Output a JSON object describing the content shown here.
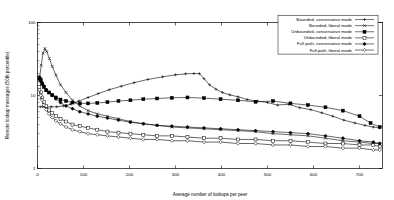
{
  "chart_data": {
    "type": "line",
    "title": "",
    "xlabel": "Average number of lookups per peer",
    "ylabel": "Remote lookup messages (50th percentile)",
    "xlim": [
      0,
      750
    ],
    "ylim": [
      1,
      100
    ],
    "yscale": "log",
    "grid": false,
    "legend_position": "top-right",
    "xticks": [
      0,
      100,
      200,
      300,
      400,
      500,
      600,
      700
    ],
    "xtick_labels": [
      "0",
      "100",
      "200",
      "300",
      "400",
      "500",
      "600",
      "700"
    ],
    "yticks": [
      1,
      10,
      100
    ],
    "ytick_labels": [
      "1",
      "10",
      "100"
    ],
    "series": [
      {
        "name": "Bounded, conservative mode",
        "marker": "plus",
        "filled": false,
        "color": "#000000",
        "points": [
          [
            6,
            7.0
          ],
          [
            12,
            7.0
          ],
          [
            20,
            7.0
          ],
          [
            30,
            7.0
          ],
          [
            42,
            7.0
          ],
          [
            56,
            7.2
          ],
          [
            72,
            7.6
          ],
          [
            90,
            8.4
          ],
          [
            110,
            9.4
          ],
          [
            132,
            10.6
          ],
          [
            156,
            12.0
          ],
          [
            182,
            13.4
          ],
          [
            210,
            15.0
          ],
          [
            240,
            16.6
          ],
          [
            272,
            18.0
          ],
          [
            300,
            19.2
          ],
          [
            322,
            19.8
          ],
          [
            340,
            20.0
          ],
          [
            352,
            19.9
          ],
          [
            362,
            17.0
          ],
          [
            374,
            14.0
          ],
          [
            388,
            12.2
          ],
          [
            402,
            11.0
          ],
          [
            418,
            10.2
          ],
          [
            436,
            9.6
          ],
          [
            456,
            8.8
          ],
          [
            478,
            8.4
          ],
          [
            500,
            8.0
          ],
          [
            522,
            7.4
          ],
          [
            546,
            7.6
          ],
          [
            570,
            6.8
          ],
          [
            594,
            6.4
          ],
          [
            618,
            5.8
          ],
          [
            642,
            5.2
          ],
          [
            666,
            4.6
          ],
          [
            690,
            4.2
          ],
          [
            712,
            3.9
          ],
          [
            730,
            3.7
          ],
          [
            744,
            3.6
          ]
        ]
      },
      {
        "name": "Bounded, liberal mode",
        "marker": "cross",
        "filled": false,
        "color": "#000000",
        "points": [
          [
            4,
            16.0
          ],
          [
            8,
            26.0
          ],
          [
            12,
            38.0
          ],
          [
            16,
            44.0
          ],
          [
            20,
            40.0
          ],
          [
            26,
            32.0
          ],
          [
            32,
            25.0
          ],
          [
            40,
            19.0
          ],
          [
            50,
            14.0
          ],
          [
            62,
            11.0
          ],
          [
            76,
            8.6
          ],
          [
            92,
            7.2
          ],
          [
            110,
            6.2
          ],
          [
            130,
            5.6
          ],
          [
            152,
            5.2
          ],
          [
            176,
            4.8
          ],
          [
            202,
            4.4
          ],
          [
            230,
            4.1
          ],
          [
            260,
            3.9
          ],
          [
            292,
            3.7
          ],
          [
            326,
            3.6
          ],
          [
            362,
            3.5
          ],
          [
            398,
            3.4
          ],
          [
            436,
            3.3
          ],
          [
            474,
            3.2
          ],
          [
            512,
            3.0
          ],
          [
            550,
            2.9
          ],
          [
            588,
            2.8
          ],
          [
            626,
            2.6
          ],
          [
            664,
            2.4
          ],
          [
            700,
            2.3
          ],
          [
            730,
            2.2
          ],
          [
            744,
            2.2
          ]
        ]
      },
      {
        "name": "Unbounded, conservative mode",
        "marker": "square",
        "filled": true,
        "color": "#000000",
        "points": [
          [
            4,
            17.0
          ],
          [
            7,
            16.0
          ],
          [
            10,
            14.5
          ],
          [
            14,
            13.0
          ],
          [
            19,
            11.8
          ],
          [
            25,
            11.0
          ],
          [
            32,
            10.2
          ],
          [
            40,
            9.4
          ],
          [
            50,
            8.8
          ],
          [
            62,
            8.4
          ],
          [
            76,
            8.0
          ],
          [
            92,
            7.8
          ],
          [
            110,
            7.8
          ],
          [
            130,
            7.9
          ],
          [
            152,
            8.1
          ],
          [
            176,
            8.4
          ],
          [
            202,
            8.6
          ],
          [
            230,
            8.9
          ],
          [
            260,
            9.1
          ],
          [
            292,
            9.3
          ],
          [
            326,
            9.4
          ],
          [
            362,
            9.2
          ],
          [
            398,
            8.9
          ],
          [
            436,
            8.6
          ],
          [
            474,
            8.2
          ],
          [
            512,
            8.4
          ],
          [
            550,
            7.8
          ],
          [
            588,
            7.4
          ],
          [
            626,
            6.9
          ],
          [
            664,
            6.2
          ],
          [
            700,
            5.2
          ],
          [
            724,
            4.2
          ],
          [
            744,
            3.7
          ]
        ]
      },
      {
        "name": "Unbounded, liberal mode",
        "marker": "square",
        "filled": false,
        "color": "#000000",
        "points": [
          [
            4,
            13.0
          ],
          [
            7,
            11.0
          ],
          [
            10,
            9.4
          ],
          [
            14,
            8.2
          ],
          [
            19,
            7.2
          ],
          [
            25,
            6.4
          ],
          [
            32,
            5.8
          ],
          [
            40,
            5.2
          ],
          [
            50,
            4.8
          ],
          [
            62,
            4.4
          ],
          [
            76,
            4.0
          ],
          [
            92,
            3.8
          ],
          [
            110,
            3.6
          ],
          [
            130,
            3.4
          ],
          [
            152,
            3.2
          ],
          [
            176,
            3.1
          ],
          [
            202,
            3.0
          ],
          [
            230,
            2.9
          ],
          [
            260,
            2.8
          ],
          [
            292,
            2.8
          ],
          [
            326,
            2.7
          ],
          [
            362,
            2.6
          ],
          [
            398,
            2.6
          ],
          [
            436,
            2.5
          ],
          [
            474,
            2.5
          ],
          [
            512,
            2.4
          ],
          [
            550,
            2.4
          ],
          [
            588,
            2.3
          ],
          [
            626,
            2.2
          ],
          [
            664,
            2.2
          ],
          [
            700,
            2.1
          ],
          [
            730,
            2.1
          ],
          [
            744,
            2.0
          ]
        ]
      },
      {
        "name": "Full path, conservative mode",
        "marker": "diamond",
        "filled": true,
        "color": "#000000",
        "points": [
          [
            4,
            18.0
          ],
          [
            7,
            17.0
          ],
          [
            10,
            15.0
          ],
          [
            14,
            13.5
          ],
          [
            19,
            12.0
          ],
          [
            25,
            11.0
          ],
          [
            32,
            10.0
          ],
          [
            40,
            9.0
          ],
          [
            50,
            8.0
          ],
          [
            62,
            7.2
          ],
          [
            76,
            6.6
          ],
          [
            92,
            6.0
          ],
          [
            110,
            5.6
          ],
          [
            130,
            5.2
          ],
          [
            152,
            4.9
          ],
          [
            176,
            4.6
          ],
          [
            202,
            4.3
          ],
          [
            230,
            4.1
          ],
          [
            260,
            3.9
          ],
          [
            292,
            3.8
          ],
          [
            326,
            3.7
          ],
          [
            362,
            3.6
          ],
          [
            398,
            3.5
          ],
          [
            436,
            3.4
          ],
          [
            474,
            3.3
          ],
          [
            512,
            3.2
          ],
          [
            550,
            3.1
          ],
          [
            588,
            3.0
          ],
          [
            626,
            2.8
          ],
          [
            664,
            2.6
          ],
          [
            700,
            2.4
          ],
          [
            730,
            2.3
          ],
          [
            744,
            2.2
          ]
        ]
      },
      {
        "name": "Full path, liberal mode",
        "marker": "diamond",
        "filled": false,
        "color": "#000000",
        "points": [
          [
            4,
            12.0
          ],
          [
            7,
            10.0
          ],
          [
            10,
            8.6
          ],
          [
            14,
            7.4
          ],
          [
            19,
            6.4
          ],
          [
            25,
            5.6
          ],
          [
            32,
            5.0
          ],
          [
            40,
            4.5
          ],
          [
            50,
            4.1
          ],
          [
            62,
            3.7
          ],
          [
            76,
            3.4
          ],
          [
            92,
            3.2
          ],
          [
            110,
            3.0
          ],
          [
            130,
            2.9
          ],
          [
            152,
            2.8
          ],
          [
            176,
            2.7
          ],
          [
            202,
            2.6
          ],
          [
            230,
            2.5
          ],
          [
            260,
            2.5
          ],
          [
            292,
            2.4
          ],
          [
            326,
            2.4
          ],
          [
            362,
            2.3
          ],
          [
            398,
            2.3
          ],
          [
            436,
            2.2
          ],
          [
            474,
            2.2
          ],
          [
            512,
            2.1
          ],
          [
            550,
            2.1
          ],
          [
            588,
            2.0
          ],
          [
            626,
            2.0
          ],
          [
            664,
            1.9
          ],
          [
            700,
            1.9
          ],
          [
            730,
            1.8
          ],
          [
            744,
            1.8
          ]
        ]
      }
    ]
  }
}
